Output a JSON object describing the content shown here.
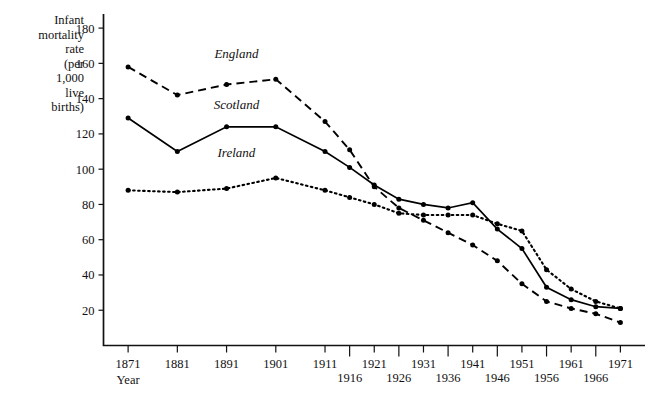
{
  "chart_data": {
    "type": "line",
    "title": "",
    "xlabel": "Year",
    "ylabel": "Infant mortality rate (per 1,000 live births)",
    "ylabel_lines": [
      "Infant",
      "mortality",
      "rate",
      "(per",
      "1,000",
      "live",
      "births)"
    ],
    "xlim": [
      1866,
      1976
    ],
    "ylim": [
      0,
      188
    ],
    "grid": false,
    "legend_position": "inline-labels",
    "y_ticks": [
      20,
      40,
      60,
      80,
      100,
      120,
      140,
      160,
      180
    ],
    "x_ticks_upper": [
      1871,
      1881,
      1891,
      1901,
      1911,
      1921,
      1931,
      1941,
      1951,
      1961,
      1971
    ],
    "x_ticks_lower": [
      1916,
      1926,
      1936,
      1946,
      1956,
      1966
    ],
    "x": [
      1871,
      1881,
      1891,
      1901,
      1911,
      1916,
      1921,
      1926,
      1931,
      1936,
      1941,
      1946,
      1951,
      1956,
      1961,
      1966,
      1971
    ],
    "series": [
      {
        "name": "England",
        "style": "dashed",
        "label_x": 1893,
        "label_y": 163,
        "values": [
          158,
          142,
          148,
          151,
          127,
          111,
          90,
          78,
          71,
          64,
          57,
          48,
          35,
          25,
          21,
          18,
          13
        ]
      },
      {
        "name": "Scotland",
        "style": "solid",
        "label_x": 1893,
        "label_y": 134,
        "values": [
          129,
          110,
          124,
          124,
          110,
          101,
          91,
          83,
          80,
          78,
          81,
          66,
          55,
          33,
          26,
          22,
          21
        ]
      },
      {
        "name": "Ireland",
        "style": "dotted",
        "label_x": 1893,
        "label_y": 107,
        "values": [
          88,
          87,
          89,
          95,
          88,
          84,
          80,
          75,
          74,
          74,
          74,
          69,
          65,
          43,
          32,
          25,
          21
        ]
      }
    ]
  },
  "axis": {
    "year_label": "Year"
  }
}
